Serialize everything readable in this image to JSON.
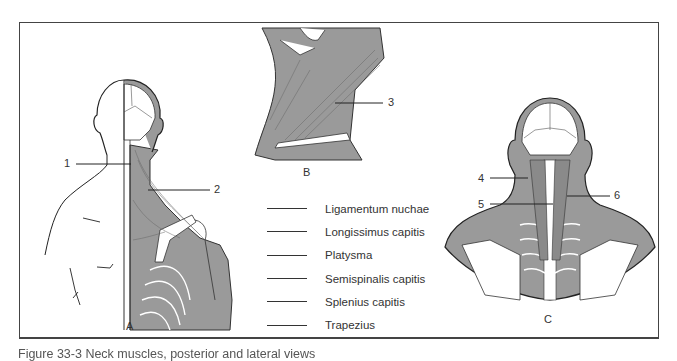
{
  "figure": {
    "panels": [
      {
        "id": "A",
        "label": "A",
        "view": "posterior torso with superficial muscles (right half)"
      },
      {
        "id": "B",
        "label": "B",
        "view": "lateral neck"
      },
      {
        "id": "C",
        "label": "C",
        "view": "posterior neck deep muscles"
      }
    ],
    "callouts": [
      {
        "number": "1",
        "panel": "A"
      },
      {
        "number": "2",
        "panel": "A"
      },
      {
        "number": "3",
        "panel": "B"
      },
      {
        "number": "4",
        "panel": "C"
      },
      {
        "number": "5",
        "panel": "C"
      },
      {
        "number": "6",
        "panel": "C"
      }
    ],
    "answer_terms": [
      "Ligamentum nuchae",
      "Longissimus capitis",
      "Platysma",
      "Semispinalis capitis",
      "Splenius capitis",
      "Trapezius"
    ],
    "caption": "Figure 33-3  Neck muscles, posterior and lateral views"
  },
  "colors": {
    "muscle_fill": "#9a9a9a",
    "line": "#333333",
    "border": "#444444"
  }
}
